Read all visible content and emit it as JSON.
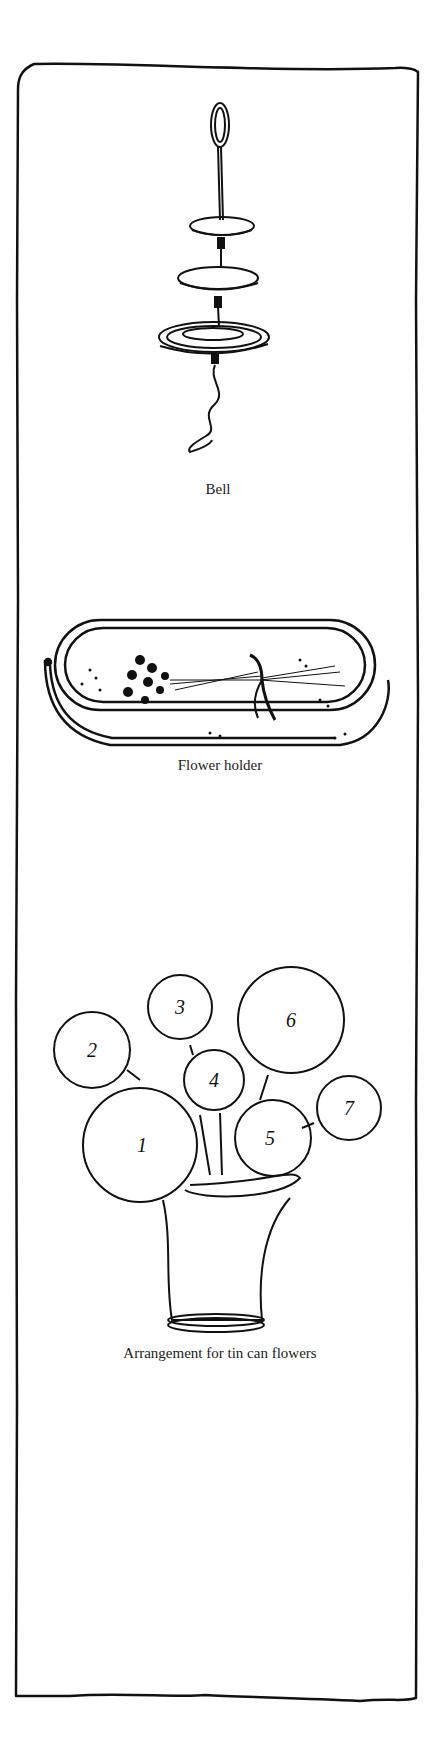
{
  "figures": [
    {
      "id": "bell",
      "caption": "Bell"
    },
    {
      "id": "flower-holder",
      "caption": "Flower holder"
    },
    {
      "id": "arrangement",
      "caption": "Arrangement for tin can flowers",
      "circle_labels": [
        "1",
        "2",
        "3",
        "4",
        "5",
        "6",
        "7"
      ]
    }
  ],
  "colors": {
    "ink": "#111111",
    "paper": "#ffffff"
  }
}
